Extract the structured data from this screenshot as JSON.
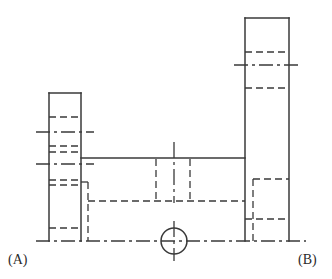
{
  "drawing": {
    "type": "orthographic-engineering-view",
    "title": "",
    "background_color": "#ffffff",
    "line_color": "#3a3a3a",
    "labels": [
      {
        "id": "a",
        "text": "(A)",
        "x": 8,
        "y": 252
      },
      {
        "id": "b",
        "text": "(B)",
        "x": 298,
        "y": 252
      }
    ],
    "stroke_widths": {
      "visible": 1.4,
      "hidden": 1.3,
      "center": 1.3
    },
    "dash_patterns": {
      "hidden": "7,4",
      "center": "14,4,3,4"
    },
    "geometry": {
      "baseline_y": 241,
      "left_column": {
        "name": "left-vertical-column",
        "x1": 49,
        "x2": 81,
        "top_y": 93,
        "bottom_y": 241
      },
      "right_column": {
        "name": "right-vertical-column",
        "x1": 245,
        "x2": 289,
        "top_y": 18,
        "bottom_y": 241
      },
      "center_body": {
        "name": "horizontal-web",
        "x1": 81,
        "x2": 245,
        "top_y": 158,
        "bottom_y": 241
      },
      "bore_circle": {
        "name": "bore-hole",
        "cx": 174,
        "cy": 241,
        "r": 13
      },
      "vertical_centerline": {
        "x": 174,
        "y1": 142,
        "y2": 201
      }
    },
    "hidden_lines": [
      {
        "name": "left-col-hidden-1",
        "x1": 49,
        "y1": 117,
        "x2": 81,
        "y2": 117
      },
      {
        "name": "left-col-hidden-2",
        "x1": 49,
        "y1": 146,
        "x2": 81,
        "y2": 146
      },
      {
        "name": "left-col-hidden-3",
        "x1": 49,
        "y1": 152,
        "x2": 81,
        "y2": 152
      },
      {
        "name": "left-col-hidden-4",
        "x1": 49,
        "y1": 180,
        "x2": 81,
        "y2": 180
      },
      {
        "name": "left-col-hidden-5",
        "x1": 49,
        "y1": 185,
        "x2": 81,
        "y2": 185
      },
      {
        "name": "left-col-hidden-6",
        "x1": 49,
        "y1": 228,
        "x2": 81,
        "y2": 228
      },
      {
        "name": "left-step-vertical",
        "x1": 88,
        "y1": 182,
        "x2": 88,
        "y2": 241
      },
      {
        "name": "left-step-horizontal",
        "x1": 88,
        "y1": 182,
        "x2": 81,
        "y2": 182
      },
      {
        "name": "web-hidden-bottom",
        "x1": 88,
        "y1": 201,
        "x2": 245,
        "y2": 201
      },
      {
        "name": "bore-left-wall",
        "x1": 156,
        "y1": 158,
        "x2": 156,
        "y2": 201
      },
      {
        "name": "bore-right-wall",
        "x1": 190,
        "y1": 158,
        "x2": 190,
        "y2": 201
      },
      {
        "name": "right-step-vertical",
        "x1": 253,
        "y1": 179,
        "x2": 253,
        "y2": 241
      },
      {
        "name": "right-step-top",
        "x1": 253,
        "y1": 179,
        "x2": 289,
        "y2": 179
      },
      {
        "name": "right-step-mid",
        "x1": 245,
        "y1": 219,
        "x2": 289,
        "y2": 219
      },
      {
        "name": "right-col-hidden-1",
        "x1": 245,
        "y1": 52,
        "x2": 289,
        "y2": 52
      },
      {
        "name": "right-col-hidden-2",
        "x1": 245,
        "y1": 88,
        "x2": 289,
        "y2": 88
      }
    ],
    "center_lines": [
      {
        "name": "left-centerline-upper",
        "x1": 36,
        "y1": 132,
        "x2": 94,
        "y2": 132
      },
      {
        "name": "left-centerline-lower",
        "x1": 36,
        "y1": 164,
        "x2": 94,
        "y2": 164
      },
      {
        "name": "right-centerline",
        "x1": 234,
        "y1": 65,
        "x2": 300,
        "y2": 65
      },
      {
        "name": "baseline-centerline",
        "x1": 36,
        "y1": 241,
        "x2": 306,
        "y2": 241
      },
      {
        "name": "bore-vertical-centerline",
        "x1": 174,
        "y1": 142,
        "x2": 174,
        "y2": 201
      },
      {
        "name": "bore-cross-vertical",
        "x1": 174,
        "y1": 222,
        "x2": 174,
        "y2": 260
      }
    ]
  }
}
